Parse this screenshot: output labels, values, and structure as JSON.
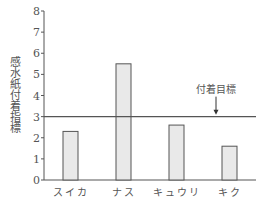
{
  "chart_data": {
    "type": "bar",
    "title": "",
    "xlabel": "",
    "ylabel": "感水紙付着指標",
    "categories": [
      "スイカ",
      "ナス",
      "キュウリ",
      "キク"
    ],
    "values": [
      2.3,
      5.5,
      2.6,
      1.6
    ],
    "ylim": [
      0,
      8
    ],
    "yticks": [
      0,
      1,
      2,
      3,
      4,
      5,
      6,
      7,
      8
    ],
    "grid": false,
    "legend": null,
    "reference_line": {
      "y": 3,
      "label": "付着目標"
    },
    "colors": {
      "bar_fill": "#e9e9e9",
      "bar_stroke": "#555555",
      "axis": "#555555",
      "line": "#555555"
    }
  }
}
